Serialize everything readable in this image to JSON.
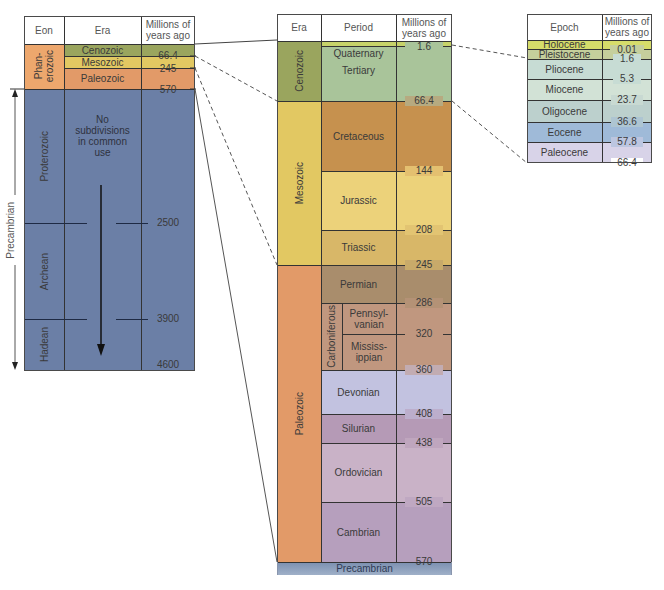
{
  "colors": {
    "cenozoic": "#9aa55e",
    "mesozoic": "#e2c862",
    "paleozoic": "#e29a68",
    "precambrian": "#6b7fa6",
    "phanerozoic": "#eda76d",
    "quaternary": "#c7d36a",
    "tertiary": "#a9c49a",
    "cretaceous": "#c6914e",
    "jurassic": "#ecd27a",
    "triassic": "#d8b768",
    "permian": "#a98d6c",
    "carboniferous": "#c0977f",
    "devonian": "#c2c2e0",
    "silurian": "#b59ab6",
    "ordovician": "#c9b2c7",
    "cambrian": "#b69fbd",
    "holocene": "#d6dc6a",
    "pleistocene": "#c5cf9c",
    "pliocene": "#c7dcd4",
    "miocene": "#d2e2d6",
    "oligocene": "#bcd0cd",
    "eocene": "#9fbad8",
    "paleocene": "#d8d3e8"
  },
  "table_eon": {
    "headers": {
      "eon": "Eon",
      "era": "Era",
      "mya": "Millions of years ago"
    },
    "eons": [
      {
        "name": "Phan-erozoic",
        "line1": "Phan-",
        "line2": "erozoic"
      },
      {
        "name": "Proterozoic"
      },
      {
        "name": "Archean"
      },
      {
        "name": "Hadean"
      }
    ],
    "eras": [
      {
        "name": "Cenozoic"
      },
      {
        "name": "Mesozoic"
      },
      {
        "name": "Paleozoic"
      }
    ],
    "note": {
      "line1": "No",
      "line2": "subdivisions",
      "line3": "in common",
      "line4": "use"
    },
    "ticks": [
      "66.4",
      "245",
      "570",
      "2500",
      "3900",
      "4600"
    ],
    "bracket_label": "Precambrian"
  },
  "table_period": {
    "headers": {
      "era": "Era",
      "period": "Period",
      "mya": "Millions of years ago"
    },
    "eras": [
      "Cenozoic",
      "Mesozoic",
      "Paleozoic"
    ],
    "periods": {
      "quaternary": "Quaternary",
      "tertiary": "Tertiary",
      "cretaceous": "Cretaceous",
      "jurassic": "Jurassic",
      "triassic": "Triassic",
      "permian": "Permian",
      "carboniferous": "Carboniferous",
      "pennsylvanian_1": "Pennsyl-",
      "pennsylvanian_2": "vanian",
      "mississippian_1": "Mississ-",
      "mississippian_2": "ippian",
      "devonian": "Devonian",
      "silurian": "Silurian",
      "ordovician": "Ordovician",
      "cambrian": "Cambrian"
    },
    "footer": "Precambrian",
    "ticks": [
      "1.6",
      "66.4",
      "144",
      "208",
      "245",
      "286",
      "320",
      "360",
      "408",
      "438",
      "505",
      "570"
    ]
  },
  "table_epoch": {
    "headers": {
      "epoch": "Epoch",
      "mya": "Millions of years ago"
    },
    "epochs": [
      "Holocene",
      "Pleistocene",
      "Pliocene",
      "Miocene",
      "Oligocene",
      "Eocene",
      "Paleocene"
    ],
    "ticks": [
      "0.01",
      "1.6",
      "5.3",
      "23.7",
      "36.6",
      "57.8",
      "66.4"
    ]
  }
}
